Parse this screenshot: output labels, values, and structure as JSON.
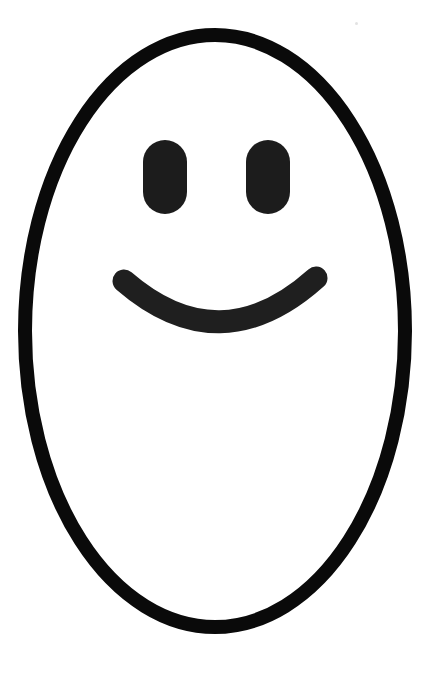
{
  "document": {
    "title": "Smiley Face",
    "description": "Hand-drawn style smiley face line drawing on white background",
    "alt_text": "A tall black outlined oval face with two rounded rectangular eyes and a curved smiling mouth",
    "canvas": {
      "width": 442,
      "height": 677,
      "background_color": "#ffffff"
    }
  },
  "artwork": {
    "name": "smiley-face",
    "style": "line-art",
    "ink_color": "#0a0a0a",
    "feature_color": "#1c1c1c",
    "parts": [
      {
        "name": "face-outline",
        "shape": "ellipse",
        "center_x": 215,
        "center_y": 331,
        "radius_x": 190,
        "radius_y": 296,
        "stroke_width": 14,
        "fill": "none",
        "stroke_color": "#0a0a0a"
      },
      {
        "name": "left-eye",
        "shape": "capsule",
        "x": 143,
        "y": 140,
        "width": 44,
        "height": 74,
        "corner_radius": 22,
        "fill": "#1c1c1c"
      },
      {
        "name": "right-eye",
        "shape": "capsule",
        "x": 246,
        "y": 140,
        "width": 44,
        "height": 74,
        "corner_radius": 22,
        "fill": "#1c1c1c"
      },
      {
        "name": "mouth",
        "shape": "arc",
        "start_x": 124,
        "start_y": 281,
        "end_x": 316,
        "end_y": 278,
        "control_x": 220,
        "control_y": 364,
        "stroke_width": 23,
        "stroke_color": "#1f1f1f",
        "fill": "none",
        "linecap": "round",
        "expression": "smile"
      }
    ],
    "artifacts": [
      {
        "name": "dust-speck",
        "x": 355,
        "y": 22,
        "color": "#d8d8d8"
      }
    ]
  }
}
